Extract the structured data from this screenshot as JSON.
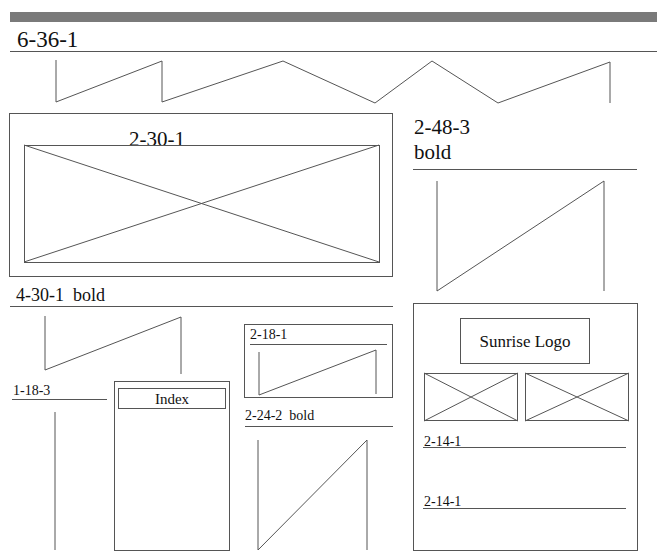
{
  "header": {
    "title": "6-36-1"
  },
  "hero": {
    "label": "2-30-1"
  },
  "side_heading": {
    "line1": "2-48-3",
    "line2": "bold"
  },
  "section_heading": {
    "label": "4-30-1  bold"
  },
  "left_column": {
    "label": "1-18-3"
  },
  "index_panel": {
    "button_label": "Index"
  },
  "small_box": {
    "label": "2-18-1"
  },
  "mid_heading": {
    "label": "2-24-2  bold"
  },
  "right_panel": {
    "logo_label": "Sunrise Logo",
    "items": [
      {
        "label": "2-14-1"
      },
      {
        "label": "2-14-1"
      }
    ]
  },
  "colors": {
    "stroke": "#555555",
    "bar": "#7a7a7a",
    "background": "#ffffff"
  }
}
